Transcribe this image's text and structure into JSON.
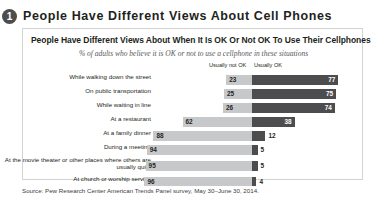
{
  "header": {
    "badge_number": "1",
    "title": "People Have Different Views About Cell Phones"
  },
  "figure": {
    "title": "People Have Different Views About When It Is OK Or Not OK To Use Their Cellphones",
    "subtitle": "% of adults who believe it is OK or not to use a cellphone in these situations",
    "legend": {
      "not_ok": "Usually not OK",
      "ok": "Usually OK"
    }
  },
  "source": {
    "text": "Source: Pew Research Center American Trends Panel survey, May 30–June 30, 2014."
  },
  "chart_data": {
    "type": "bar",
    "subtype": "diverging-stacked-bar",
    "title": "People Have Different Views About When It Is OK Or Not OK To Use Their Cellphones",
    "subtitle": "% of adults who believe it is OK or not to use a cellphone in these situations",
    "xlabel": "",
    "ylabel": "",
    "xlim": [
      0,
      100
    ],
    "grid": false,
    "legend_position": "top-right",
    "categories": [
      "While walking down the street",
      "On public transportation",
      "While waiting in line",
      "At a restaurant",
      "At a family dinner",
      "During a meeting",
      "At the movie theater or other places where others are usually quiet",
      "At church or worship service"
    ],
    "series": [
      {
        "name": "Usually not OK",
        "color": "#c7c8ca",
        "values": [
          23,
          25,
          26,
          62,
          88,
          94,
          95,
          96
        ]
      },
      {
        "name": "Usually OK",
        "color": "#4d4d4f",
        "values": [
          77,
          75,
          74,
          38,
          12,
          5,
          5,
          4
        ]
      }
    ],
    "source": "Source: Pew Research Center American Trends Panel survey, May 30–June 30, 2014."
  },
  "rows": [
    {
      "label": "While walking down the street",
      "not_ok": "23",
      "ok": "77"
    },
    {
      "label": "On public transportation",
      "not_ok": "25",
      "ok": "75"
    },
    {
      "label": "While waiting in line",
      "not_ok": "26",
      "ok": "74"
    },
    {
      "label": "At a restaurant",
      "not_ok": "62",
      "ok": "38"
    },
    {
      "label": "At a family dinner",
      "not_ok": "88",
      "ok": "12"
    },
    {
      "label": "During a meeting",
      "not_ok": "94",
      "ok": "5"
    },
    {
      "label": "At the movie theater or other places where others are usually quiet",
      "not_ok": "95",
      "ok": "5"
    },
    {
      "label": "At church or worship service",
      "not_ok": "96",
      "ok": "4"
    }
  ]
}
